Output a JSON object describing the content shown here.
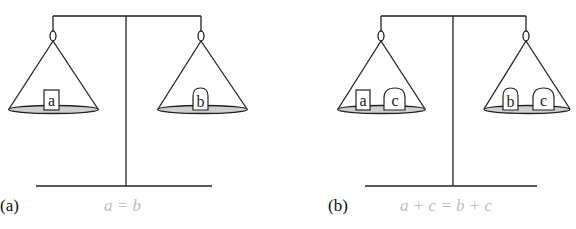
{
  "figure": {
    "panels": [
      {
        "id": "a",
        "label": "(a)",
        "equation": "a = b",
        "left_pan": {
          "weights": [
            {
              "name": "a",
              "shape": "rectangle"
            }
          ]
        },
        "right_pan": {
          "weights": [
            {
              "name": "b",
              "shape": "rounded-top"
            }
          ]
        }
      },
      {
        "id": "b",
        "label": "(b)",
        "equation": "a + c = b + c",
        "left_pan": {
          "weights": [
            {
              "name": "a",
              "shape": "rectangle"
            },
            {
              "name": "c",
              "shape": "rounded-top"
            }
          ]
        },
        "right_pan": {
          "weights": [
            {
              "name": "b",
              "shape": "rounded-top"
            },
            {
              "name": "c",
              "shape": "rounded-top"
            }
          ]
        }
      }
    ],
    "colors": {
      "line": "#222222",
      "pan_fill": "#cfcfcf",
      "equation_text": "#bdbdbd"
    }
  }
}
